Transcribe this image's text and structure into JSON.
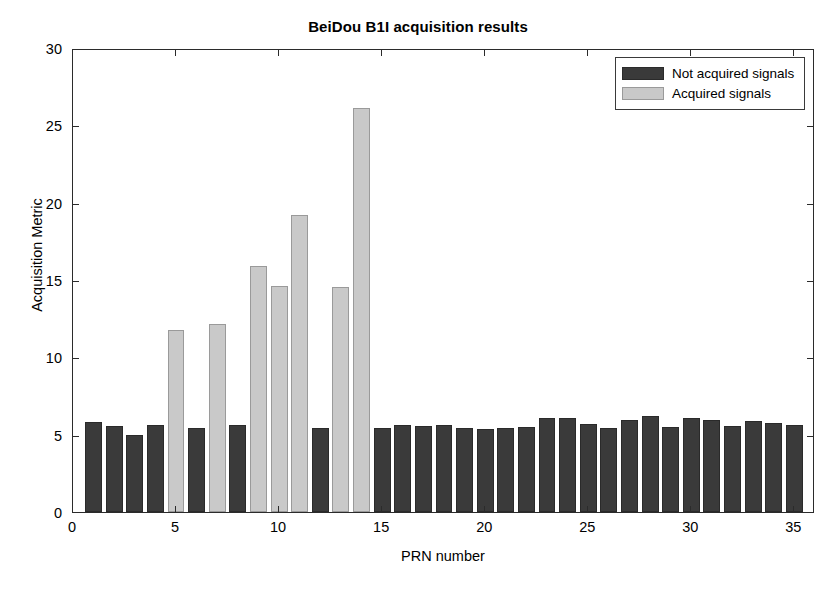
{
  "chart_data": {
    "type": "bar",
    "title": "BeiDou B1I acquisition results",
    "xlabel": "PRN number",
    "ylabel": "Acquisition Metric",
    "xlim": [
      0,
      36
    ],
    "ylim": [
      0,
      30
    ],
    "xticks": [
      0,
      5,
      10,
      15,
      20,
      25,
      30,
      35
    ],
    "yticks": [
      0,
      5,
      10,
      15,
      20,
      25,
      30
    ],
    "grid": false,
    "legend_position": "top-right",
    "legend": [
      {
        "name": "Not acquired signals",
        "color": "#3a3a3a"
      },
      {
        "name": "Acquired signals",
        "color": "#c9c9c9"
      }
    ],
    "categories": [
      1,
      2,
      3,
      4,
      5,
      6,
      7,
      8,
      9,
      10,
      11,
      12,
      13,
      14,
      15,
      16,
      17,
      18,
      19,
      20,
      21,
      22,
      23,
      24,
      25,
      26,
      27,
      28,
      29,
      30,
      31,
      32,
      33,
      34,
      35
    ],
    "values": [
      5.85,
      5.55,
      4.95,
      5.65,
      11.75,
      5.4,
      12.15,
      5.6,
      15.9,
      14.6,
      19.2,
      5.45,
      14.55,
      26.1,
      5.4,
      5.6,
      5.55,
      5.65,
      5.45,
      5.35,
      5.4,
      5.5,
      6.1,
      6.05,
      5.7,
      5.45,
      5.95,
      6.2,
      5.5,
      6.1,
      5.95,
      5.55,
      5.9,
      5.75,
      5.6
    ],
    "acquired": [
      false,
      false,
      false,
      false,
      true,
      false,
      true,
      false,
      true,
      true,
      true,
      false,
      true,
      true,
      false,
      false,
      false,
      false,
      false,
      false,
      false,
      false,
      false,
      false,
      false,
      false,
      false,
      false,
      false,
      false,
      false,
      false,
      false,
      false,
      false
    ],
    "series": [
      {
        "name": "Acquired signals",
        "color": "#c9c9c9",
        "points": [
          {
            "prn": 5,
            "value": 11.75
          },
          {
            "prn": 7,
            "value": 12.15
          },
          {
            "prn": 9,
            "value": 15.9
          },
          {
            "prn": 10,
            "value": 14.6
          },
          {
            "prn": 11,
            "value": 19.2
          },
          {
            "prn": 13,
            "value": 14.55
          },
          {
            "prn": 14,
            "value": 26.1
          }
        ]
      },
      {
        "name": "Not acquired signals",
        "color": "#3a3a3a",
        "points": [
          {
            "prn": 1,
            "value": 5.85
          },
          {
            "prn": 2,
            "value": 5.55
          },
          {
            "prn": 3,
            "value": 4.95
          },
          {
            "prn": 4,
            "value": 5.65
          },
          {
            "prn": 6,
            "value": 5.4
          },
          {
            "prn": 8,
            "value": 5.6
          },
          {
            "prn": 12,
            "value": 5.45
          },
          {
            "prn": 15,
            "value": 5.4
          },
          {
            "prn": 16,
            "value": 5.6
          },
          {
            "prn": 17,
            "value": 5.55
          },
          {
            "prn": 18,
            "value": 5.65
          },
          {
            "prn": 19,
            "value": 5.45
          },
          {
            "prn": 20,
            "value": 5.35
          },
          {
            "prn": 21,
            "value": 5.4
          },
          {
            "prn": 22,
            "value": 5.5
          },
          {
            "prn": 23,
            "value": 6.1
          },
          {
            "prn": 24,
            "value": 6.05
          },
          {
            "prn": 25,
            "value": 5.7
          },
          {
            "prn": 26,
            "value": 5.45
          },
          {
            "prn": 27,
            "value": 5.95
          },
          {
            "prn": 28,
            "value": 6.2
          },
          {
            "prn": 29,
            "value": 5.5
          },
          {
            "prn": 30,
            "value": 6.1
          },
          {
            "prn": 31,
            "value": 5.95
          },
          {
            "prn": 32,
            "value": 5.55
          },
          {
            "prn": 33,
            "value": 5.9
          },
          {
            "prn": 34,
            "value": 5.75
          },
          {
            "prn": 35,
            "value": 5.6
          }
        ]
      }
    ]
  },
  "colors": {
    "not_acquired": "#3a3a3a",
    "acquired": "#c9c9c9",
    "axis": "#2b2b2b",
    "background": "#ffffff"
  }
}
